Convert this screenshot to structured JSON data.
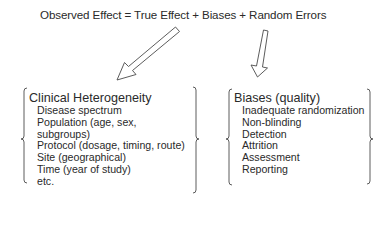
{
  "equation": "Observed Effect = True Effect + Biases + Random Errors",
  "left_box": {
    "heading": "Clinical Heterogeneity",
    "items": [
      "Disease spectrum",
      "Population (age, sex,",
      "subgroups)",
      "Protocol (dosage, timing, route)",
      "Site (geographical)",
      "Time (year of study)",
      "etc."
    ]
  },
  "right_box": {
    "heading": "Biases (quality)",
    "items": [
      "Inadequate randomization",
      "Non-blinding",
      "Detection",
      "Attrition",
      "Assessment",
      "Reporting"
    ]
  },
  "arrows": [
    {
      "from": "True Effect",
      "to": "Clinical Heterogeneity",
      "style": "hollow"
    },
    {
      "from": "Biases",
      "to": "Biases (quality)",
      "style": "hollow"
    }
  ],
  "colors": {
    "text": "#2a2a2a",
    "stroke": "#4a4a4a",
    "background": "#ffffff"
  }
}
